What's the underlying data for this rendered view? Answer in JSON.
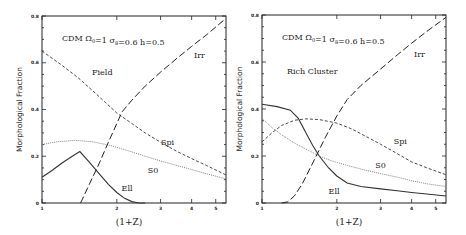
{
  "chart_data": [
    {
      "type": "line",
      "panel": "left",
      "title": "CDM Ω0=1 σ8=0.6 h=0.5",
      "environment": "Field",
      "xlabel": "(1+Z)",
      "ylabel": "Morphological Fraction",
      "xscale": "log",
      "xlim": [
        1,
        5.5
      ],
      "ylim": [
        0,
        0.8
      ],
      "xticks": [
        1,
        2,
        3,
        4,
        5
      ],
      "yticks": [
        0,
        0.2,
        0.4,
        0.6,
        0.8
      ],
      "xtick_labels": [
        "1",
        "2",
        "3",
        "4",
        "5"
      ],
      "ytick_labels": [
        "0",
        "0.2",
        "0.4",
        "0.6",
        "0.8"
      ],
      "series": [
        {
          "name": "Ell",
          "style": "solid",
          "label_pos": [
            2.2,
            0.05
          ],
          "x": [
            1.0,
            1.1,
            1.2,
            1.3,
            1.42,
            1.55,
            1.7,
            1.85,
            2.0,
            2.15,
            2.3,
            2.45,
            2.6
          ],
          "y": [
            0.11,
            0.14,
            0.17,
            0.195,
            0.22,
            0.175,
            0.125,
            0.08,
            0.045,
            0.02,
            0.006,
            0.0,
            0.0
          ]
        },
        {
          "name": "S0",
          "style": "dotted",
          "label_pos": [
            2.8,
            0.13
          ],
          "x": [
            1.0,
            1.15,
            1.35,
            1.6,
            1.9,
            2.2,
            2.6,
            3.0,
            3.5,
            4.0,
            4.6,
            5.5
          ],
          "y": [
            0.25,
            0.262,
            0.268,
            0.262,
            0.245,
            0.225,
            0.2,
            0.18,
            0.16,
            0.143,
            0.125,
            0.103
          ]
        },
        {
          "name": "Spi",
          "style": "short-dash",
          "label_pos": [
            3.2,
            0.25
          ],
          "x": [
            1.0,
            1.2,
            1.4,
            1.6,
            1.8,
            2.0,
            2.3,
            2.6,
            3.0,
            3.5,
            4.0,
            4.6,
            5.5
          ],
          "y": [
            0.65,
            0.59,
            0.535,
            0.48,
            0.43,
            0.385,
            0.34,
            0.3,
            0.26,
            0.22,
            0.19,
            0.16,
            0.12
          ]
        },
        {
          "name": "Irr",
          "style": "long-dash",
          "label_pos": [
            4.3,
            0.62
          ],
          "x": [
            1.43,
            1.55,
            1.7,
            1.85,
            2.0,
            2.1,
            2.3,
            2.6,
            3.0,
            3.5,
            4.0,
            4.6,
            5.5
          ],
          "y": [
            0.0,
            0.08,
            0.17,
            0.26,
            0.34,
            0.39,
            0.44,
            0.5,
            0.56,
            0.62,
            0.67,
            0.72,
            0.79
          ]
        }
      ]
    },
    {
      "type": "line",
      "panel": "right",
      "title": "CDM Ω0=1 σ8=0.6 h=0.5",
      "environment": "Rich Cluster",
      "xlabel": "(1+Z)",
      "ylabel": "Morphological Fraction",
      "xscale": "log",
      "xlim": [
        1,
        5.5
      ],
      "ylim": [
        0,
        0.8
      ],
      "xticks": [
        1,
        2,
        3,
        4,
        5
      ],
      "yticks": [
        0,
        0.2,
        0.4,
        0.6,
        0.8
      ],
      "xtick_labels": [
        "1",
        "2",
        "3",
        "4",
        "5"
      ],
      "ytick_labels": [
        "0",
        "0.2",
        "0.4",
        "0.6",
        "0.8"
      ],
      "series": [
        {
          "name": "Ell",
          "style": "solid",
          "label_pos": [
            1.95,
            0.04
          ],
          "x": [
            1.0,
            1.15,
            1.3,
            1.4,
            1.5,
            1.6,
            1.7,
            1.85,
            2.0,
            2.2,
            2.5,
            3.0,
            3.5,
            4.0,
            4.6,
            5.5
          ],
          "y": [
            0.42,
            0.41,
            0.395,
            0.36,
            0.3,
            0.245,
            0.2,
            0.15,
            0.115,
            0.085,
            0.07,
            0.06,
            0.052,
            0.045,
            0.038,
            0.03
          ]
        },
        {
          "name": "S0",
          "style": "dotted",
          "label_pos": [
            3.0,
            0.15
          ],
          "x": [
            1.0,
            1.1,
            1.2,
            1.35,
            1.5,
            1.7,
            1.9,
            2.2,
            2.6,
            3.0,
            3.5,
            4.0,
            4.6,
            5.5
          ],
          "y": [
            0.36,
            0.32,
            0.29,
            0.255,
            0.23,
            0.2,
            0.18,
            0.16,
            0.14,
            0.125,
            0.11,
            0.095,
            0.082,
            0.07
          ]
        },
        {
          "name": "Spi",
          "style": "short-dash",
          "label_pos": [
            3.6,
            0.25
          ],
          "x": [
            1.0,
            1.1,
            1.2,
            1.35,
            1.5,
            1.7,
            2.0,
            2.3,
            2.6,
            3.0,
            3.5,
            4.0,
            4.6,
            5.5
          ],
          "y": [
            0.26,
            0.3,
            0.33,
            0.352,
            0.358,
            0.355,
            0.34,
            0.315,
            0.285,
            0.25,
            0.21,
            0.175,
            0.15,
            0.12
          ]
        },
        {
          "name": "Irr",
          "style": "long-dash",
          "label_pos": [
            4.3,
            0.62
          ],
          "x": [
            1.2,
            1.27,
            1.35,
            1.45,
            1.6,
            1.8,
            2.0,
            2.2,
            2.5,
            3.0,
            3.5,
            4.0,
            4.6,
            5.5
          ],
          "y": [
            0.0,
            0.005,
            0.03,
            0.08,
            0.17,
            0.28,
            0.37,
            0.44,
            0.5,
            0.57,
            0.63,
            0.68,
            0.73,
            0.79
          ]
        }
      ]
    }
  ],
  "figure": {
    "panels": [
      {
        "id": "left",
        "frame": {
          "x0": 42,
          "y0": 16,
          "x1": 226,
          "y1": 203
        }
      },
      {
        "id": "right",
        "frame": {
          "x0": 262,
          "y0": 15,
          "x1": 446,
          "y1": 203
        }
      }
    ],
    "params_text": {
      "prefix": "CDM",
      "omega": "Ω",
      "omega_sub": "0",
      "omega_val": "=1",
      "sigma": "σ",
      "sigma_sub": "8",
      "sigma_val": "=0.6",
      "h": "h=0.5"
    }
  }
}
